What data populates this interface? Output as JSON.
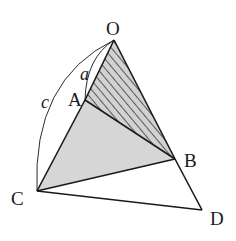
{
  "diagram": {
    "type": "geometry",
    "points": {
      "O": {
        "label": "O",
        "x": 114,
        "y": 40
      },
      "A": {
        "label": "A",
        "x": 85,
        "y": 100
      },
      "B": {
        "label": "B",
        "x": 175,
        "y": 159
      },
      "C": {
        "label": "C",
        "x": 37,
        "y": 191
      },
      "D": {
        "label": "D",
        "x": 202,
        "y": 210
      }
    },
    "segments": [
      "OA",
      "OB",
      "AB",
      "AC",
      "BC",
      "BD",
      "CD"
    ],
    "regions": [
      {
        "name": "triangle-OAB",
        "fill": "hatched",
        "color": "#cfcfcf"
      },
      {
        "name": "triangle-ABC",
        "fill": "gray",
        "color": "#d6d6d6"
      }
    ],
    "arcs": [
      {
        "label": "a",
        "from": "O",
        "to": "A"
      },
      {
        "label": "c",
        "from": "O",
        "to": "C"
      }
    ],
    "labels": {
      "O": "O",
      "A": "A",
      "B": "B",
      "C": "C",
      "D": "D",
      "a": "a",
      "c": "c"
    }
  }
}
